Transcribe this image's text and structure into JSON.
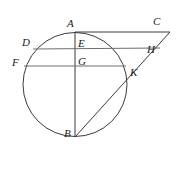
{
  "figure": {
    "kind": "geometry-diagram",
    "title": "",
    "width": 176,
    "height": 180,
    "background_color": "#ffffff",
    "stroke_color": "#3a3a3a",
    "chord_color": "#6e6e6e",
    "label_color": "#1a1a1a"
  },
  "circle": {
    "center_x": 75,
    "center_y": 84.5,
    "radius": 52,
    "stroke_color": "#3a3a3a",
    "stroke_width": 1
  },
  "points": {
    "A": {
      "label": "A",
      "x": 75,
      "y": 32,
      "label_x": 67,
      "label_y": 18
    },
    "B": {
      "label": "B",
      "x": 75,
      "y": 137,
      "label_x": 64,
      "label_y": 128
    },
    "C": {
      "label": "C",
      "x": 170,
      "y": 32,
      "label_x": 153,
      "label_y": 16
    },
    "D": {
      "label": "D",
      "x": 33,
      "y": 49,
      "label_x": 22,
      "label_y": 37
    },
    "E": {
      "label": "E",
      "x": 75,
      "y": 49,
      "label_x": 78,
      "label_y": 38
    },
    "F": {
      "label": "F",
      "x": 24,
      "y": 66,
      "label_x": 12,
      "label_y": 57
    },
    "G": {
      "label": "G",
      "x": 75,
      "y": 66,
      "label_x": 78,
      "label_y": 56
    },
    "H": {
      "label": "H",
      "x": 160,
      "y": 48,
      "label_x": 147,
      "label_y": 44
    },
    "K": {
      "label": "K",
      "x": 124,
      "y": 71,
      "label_x": 130,
      "label_y": 67
    }
  },
  "segments": [
    {
      "name": "segment-AC",
      "from": "A",
      "to": "C",
      "x1": 75,
      "y1": 32,
      "x2": 170,
      "y2": 32,
      "color": "#3a3a3a",
      "width": 1
    },
    {
      "name": "segment-AB-diameter",
      "from": "A",
      "to": "B",
      "x1": 75,
      "y1": 32,
      "x2": 75,
      "y2": 137,
      "color": "#3a3a3a",
      "width": 1
    },
    {
      "name": "segment-DH",
      "from": "D",
      "to": "H",
      "x1": 33,
      "y1": 49,
      "x2": 160,
      "y2": 48,
      "color": "#6e6e6e",
      "width": 1
    },
    {
      "name": "segment-FK-extended",
      "from": "F",
      "to": "K",
      "x1": 24,
      "y1": 66,
      "x2": 126,
      "y2": 66,
      "color": "#6e6e6e",
      "width": 1
    },
    {
      "name": "segment-BC",
      "from": "B",
      "to": "C",
      "x1": 75,
      "y1": 137,
      "x2": 170,
      "y2": 32,
      "color": "#3a3a3a",
      "width": 1
    }
  ],
  "label_order": [
    "A",
    "C",
    "D",
    "E",
    "H",
    "F",
    "G",
    "K",
    "B"
  ]
}
